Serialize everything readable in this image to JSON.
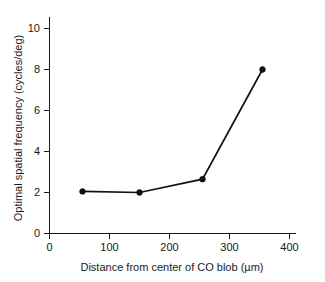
{
  "chart_data": {
    "type": "line",
    "title": "",
    "xlabel": "Distance from center of CO blob (µm)",
    "ylabel": "Optimal spatial frequency (cycles/deg)",
    "xlim": [
      0,
      420
    ],
    "ylim": [
      0,
      10.6
    ],
    "xticks": [
      0,
      100,
      200,
      300,
      400
    ],
    "xticklabels": [
      "0",
      "100",
      "200",
      "300",
      "400"
    ],
    "yticks": [
      0,
      2,
      4,
      6,
      8,
      10
    ],
    "yticklabels": [
      "0",
      "2",
      "4",
      "6",
      "8",
      "10"
    ],
    "grid": false,
    "legend": false,
    "marker": "filled-circle",
    "line_color": "#111111",
    "x": [
      55,
      150,
      255,
      355
    ],
    "values": [
      2.05,
      2.0,
      2.65,
      8.0
    ],
    "points": [
      {
        "x": 55,
        "y": 2.05
      },
      {
        "x": 150,
        "y": 2.0
      },
      {
        "x": 255,
        "y": 2.65
      },
      {
        "x": 355,
        "y": 8.0
      }
    ]
  },
  "axes": {
    "x_title": "Distance from center of CO blob (µm)",
    "y_title": "Optimal spatial frequency (cycles/deg)"
  }
}
